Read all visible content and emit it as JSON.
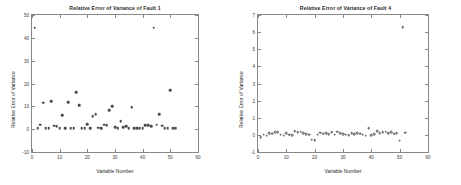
{
  "chart_data": [
    {
      "type": "scatter",
      "title": "Relative Error of Variance of Fault 1",
      "xlabel": "Variable Number",
      "ylabel": "Relative Error of Variance",
      "xlim": [
        0,
        60
      ],
      "ylim": [
        -10,
        50
      ],
      "xticks": [
        0,
        10,
        20,
        30,
        40,
        50,
        60
      ],
      "yticks": [
        -10,
        0,
        10,
        20,
        30,
        40,
        50
      ],
      "grid": false,
      "legend": "none",
      "marker": "star-filled",
      "x": [
        1,
        2,
        3,
        4,
        5,
        6,
        7,
        8,
        9,
        10,
        11,
        12,
        13,
        14,
        15,
        16,
        17,
        18,
        19,
        20,
        21,
        22,
        23,
        24,
        25,
        26,
        27,
        28,
        29,
        30,
        31,
        32,
        33,
        34,
        35,
        36,
        37,
        38,
        39,
        40,
        41,
        42,
        43,
        44,
        45,
        46,
        47,
        48,
        49,
        50,
        51,
        52
      ],
      "y": [
        44.5,
        0.3,
        1.9,
        11.6,
        0.4,
        0.4,
        12.3,
        1.6,
        1.3,
        0.5,
        6.1,
        0.3,
        11.9,
        0.3,
        0.4,
        16.2,
        10.5,
        0.3,
        0.4,
        2.3,
        0.4,
        5.7,
        6.6,
        0.6,
        0.4,
        2.0,
        1.7,
        8.4,
        10.0,
        0.8,
        0.3,
        3.5,
        0.9,
        1.4,
        0.3,
        9.5,
        0.4,
        0.3,
        0.3,
        0.3,
        1.7,
        1.8,
        1.4,
        44.5,
        1.9,
        6.6,
        1.5,
        0.3,
        0.4,
        17.0,
        0.4,
        0.4
      ]
    },
    {
      "type": "scatter",
      "title": "Relative Error of Variance of Fault 4",
      "xlabel": "Variable Number",
      "ylabel": "Relative Error of Variance",
      "xlim": [
        0,
        60
      ],
      "ylim": [
        -1,
        7
      ],
      "xticks": [
        0,
        10,
        20,
        30,
        40,
        50,
        60
      ],
      "yticks": [
        -1,
        0,
        1,
        2,
        3,
        4,
        5,
        6,
        7
      ],
      "grid": false,
      "legend": "none",
      "marker": "circle-open",
      "x": [
        1,
        2,
        3,
        4,
        5,
        6,
        7,
        8,
        9,
        10,
        11,
        12,
        13,
        14,
        15,
        16,
        17,
        18,
        19,
        20,
        21,
        22,
        23,
        24,
        25,
        26,
        27,
        28,
        29,
        30,
        31,
        32,
        33,
        34,
        35,
        36,
        37,
        38,
        39,
        40,
        41,
        42,
        43,
        44,
        45,
        46,
        47,
        48,
        49,
        50,
        51,
        52
      ],
      "y": [
        -0.12,
        0.02,
        -0.05,
        0.1,
        0.08,
        0.16,
        0.14,
        0.02,
        -0.05,
        0.1,
        0.02,
        -0.02,
        0.2,
        0.14,
        0.18,
        0.1,
        0.05,
        0.02,
        -0.28,
        -0.3,
        0.02,
        0.12,
        0.08,
        0.1,
        0.05,
        0.14,
        0.02,
        0.18,
        0.1,
        0.05,
        0.02,
        -0.02,
        0.1,
        0.05,
        0.1,
        0.08,
        0.02,
        -0.05,
        0.38,
        -0.02,
        0.05,
        0.2,
        0.1,
        0.14,
        0.18,
        0.1,
        0.16,
        0.08,
        0.1,
        -0.35,
        6.3,
        0.12
      ]
    }
  ],
  "figures": [
    {
      "id": "fault-1",
      "title": "Relative Error of Variance of Fault 1",
      "xlabel": "Variable Number",
      "ylabel": "Relative Error of Variance",
      "xticklabels": [
        "0",
        "10",
        "20",
        "30",
        "40",
        "50",
        "60"
      ],
      "yticklabels": [
        "-10",
        "0",
        "10",
        "20",
        "30",
        "40",
        "50"
      ]
    },
    {
      "id": "fault-4",
      "title": "Relative Error of Variance of Fault 4",
      "xlabel": "Variable Number",
      "ylabel": "Relative Error of Variance",
      "xticklabels": [
        "0",
        "10",
        "20",
        "30",
        "40",
        "50",
        "60"
      ],
      "yticklabels": [
        "-1",
        "0",
        "1",
        "2",
        "3",
        "4",
        "5",
        "6",
        "7"
      ]
    }
  ],
  "colors": {
    "marker": "#4a4a4a",
    "axis": "#888888",
    "text": "#2a2a2a",
    "background": "#ffffff"
  }
}
